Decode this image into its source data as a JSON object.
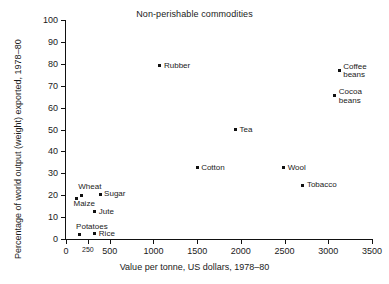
{
  "chart_data": {
    "type": "scatter",
    "title": "Non-perishable commodities",
    "xlabel": "Value per tonne, US dollars, 1978–80",
    "ylabel": "Percentage of world output (weight) exported, 1978–80",
    "xlim": [
      0,
      3500
    ],
    "ylim": [
      0,
      100
    ],
    "grid": false,
    "legend": "none",
    "xticks": [
      {
        "value": 0,
        "label": "0",
        "small": false
      },
      {
        "value": 250,
        "label": "250",
        "small": true
      },
      {
        "value": 500,
        "label": "500",
        "small": false
      },
      {
        "value": 1000,
        "label": "1000",
        "small": false
      },
      {
        "value": 1500,
        "label": "1500",
        "small": false
      },
      {
        "value": 2000,
        "label": "2000",
        "small": false
      },
      {
        "value": 2500,
        "label": "2500",
        "small": false
      },
      {
        "value": 3000,
        "label": "3000",
        "small": false
      },
      {
        "value": 3500,
        "label": "3500",
        "small": false
      }
    ],
    "yticks": [
      {
        "value": 0,
        "label": "0"
      },
      {
        "value": 10,
        "label": "10"
      },
      {
        "value": 20,
        "label": "20"
      },
      {
        "value": 30,
        "label": "30"
      },
      {
        "value": 40,
        "label": "40"
      },
      {
        "value": 50,
        "label": "50"
      },
      {
        "value": 60,
        "label": "60"
      },
      {
        "value": 70,
        "label": "70"
      },
      {
        "value": 80,
        "label": "80"
      },
      {
        "value": 90,
        "label": "90"
      },
      {
        "value": 100,
        "label": "100"
      }
    ],
    "points": [
      {
        "label": "Rubber",
        "x": 1075,
        "y": 79.0,
        "label_pos": "right"
      },
      {
        "label": "Coffee\nbeans",
        "x": 3125,
        "y": 77.0,
        "label_pos": "right"
      },
      {
        "label": "Cocoa\nbeans",
        "x": 3075,
        "y": 65.5,
        "label_pos": "right"
      },
      {
        "label": "Tea",
        "x": 1940,
        "y": 50.0,
        "label_pos": "right"
      },
      {
        "label": "Cotton",
        "x": 1500,
        "y": 32.5,
        "label_pos": "right"
      },
      {
        "label": "Wool",
        "x": 2490,
        "y": 32.5,
        "label_pos": "right"
      },
      {
        "label": "Tobacco",
        "x": 2710,
        "y": 24.5,
        "label_pos": "right"
      },
      {
        "label": "Sugar",
        "x": 390,
        "y": 20.5,
        "label_pos": "right"
      },
      {
        "label": "Wheat",
        "x": 175,
        "y": 20.0,
        "label_pos": "above"
      },
      {
        "label": "Maize",
        "x": 120,
        "y": 18.5,
        "label_pos": "below"
      },
      {
        "label": "Jute",
        "x": 330,
        "y": 12.5,
        "label_pos": "right"
      },
      {
        "label": "Rice",
        "x": 330,
        "y": 2.5,
        "label_pos": "right"
      },
      {
        "label": "Potatoes",
        "x": 150,
        "y": 2.0,
        "label_pos": "above"
      }
    ]
  }
}
